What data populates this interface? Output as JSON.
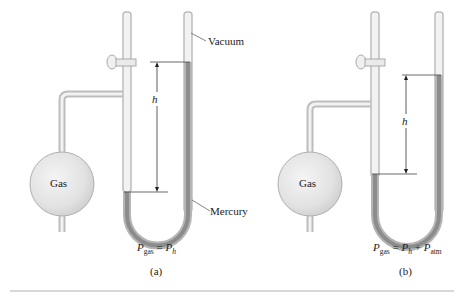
{
  "figure": {
    "panels": [
      {
        "id": "a",
        "caption": "(a)",
        "bulb_label": "Gas",
        "height_label": "h",
        "equation": {
          "lhs": "P",
          "lhs_sub": "gas",
          "eq": "=",
          "t1": "P",
          "t1_sub": "h",
          "plus": "",
          "t2": "",
          "t2_sub": ""
        },
        "labels": {
          "vacuum": "Vacuum",
          "mercury": "Mercury"
        }
      },
      {
        "id": "b",
        "caption": "(b)",
        "bulb_label": "Gas",
        "height_label": "h",
        "equation": {
          "lhs": "P",
          "lhs_sub": "gas",
          "eq": "=",
          "t1": "P",
          "t1_sub": "h",
          "plus": "+",
          "t2": "P",
          "t2_sub": "atm"
        }
      }
    ],
    "colors": {
      "glass": "#d4d4d4",
      "glass_edge": "#b8b8b8",
      "mercury": "#8c8c8c",
      "bulb": "#e6e6e6",
      "line": "#333333"
    }
  }
}
